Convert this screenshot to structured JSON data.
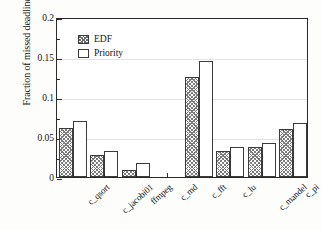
{
  "chart_data": {
    "type": "bar",
    "title": "",
    "xlabel": "",
    "ylabel": "Fraction of missed deadlines",
    "ylim": [
      0,
      0.2
    ],
    "ytick_labels": [
      "0",
      "0.05",
      "0.1",
      "0.15",
      "0.2"
    ],
    "ytick_values": [
      0,
      0.05,
      0.1,
      0.15,
      0.2
    ],
    "yminor_tick_values": [
      0.025,
      0.075,
      0.125,
      0.175
    ],
    "grid": "horizontal",
    "legend_position": "upper left",
    "categories": [
      "c_qsort",
      "c_jacobi01",
      "ffmpeg",
      "c_md",
      "c_fft",
      "c_lu",
      "c_mandel",
      "c_pi"
    ],
    "series": [
      {
        "name": "EDF",
        "pattern": "crosshatch",
        "values": [
          0.061,
          0.028,
          0.009,
          0.0,
          0.125,
          0.033,
          0.037,
          0.06
        ]
      },
      {
        "name": "Priority",
        "pattern": "solid-white",
        "values": [
          0.07,
          0.032,
          0.017,
          0.0,
          0.145,
          0.037,
          0.043,
          0.068
        ]
      }
    ]
  },
  "legend": {
    "entries": [
      {
        "label": "EDF"
      },
      {
        "label": "Priority"
      }
    ]
  },
  "colors": {
    "axis": "#2a2a2a",
    "grid": "#e2e2e2",
    "bar_edge": "#3b3b3b",
    "hatch": "#7d7d7d",
    "background": "#ffffff",
    "text": "#141414"
  }
}
